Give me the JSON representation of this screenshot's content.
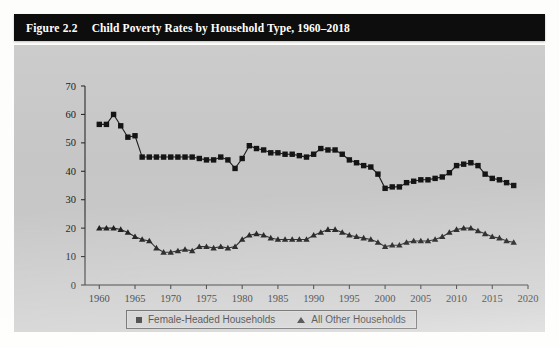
{
  "figure": {
    "number": "Figure 2.2",
    "title": "Child Poverty Rates by Household Type, 1960–2018"
  },
  "legend": {
    "items": [
      {
        "label": "Female-Headed Households",
        "marker": "square-marker"
      },
      {
        "label": "All Other Households",
        "marker": "triangle-marker"
      }
    ]
  },
  "chart_data": {
    "type": "line",
    "title": "Child Poverty Rates by Household Type, 1960–2018",
    "xlabel": "",
    "ylabel": "",
    "xlim": [
      1958,
      2020
    ],
    "ylim": [
      0,
      70
    ],
    "yticks": [
      0,
      10,
      20,
      30,
      40,
      50,
      60,
      70
    ],
    "xticks": [
      1960,
      1965,
      1970,
      1975,
      1980,
      1985,
      1990,
      1995,
      2000,
      2005,
      2010,
      2015,
      2020
    ],
    "grid": false,
    "legend_position": "bottom",
    "x": [
      1960,
      1961,
      1962,
      1963,
      1964,
      1965,
      1966,
      1967,
      1968,
      1969,
      1970,
      1971,
      1972,
      1973,
      1974,
      1975,
      1976,
      1977,
      1978,
      1979,
      1980,
      1981,
      1982,
      1983,
      1984,
      1985,
      1986,
      1987,
      1988,
      1989,
      1990,
      1991,
      1992,
      1993,
      1994,
      1995,
      1996,
      1997,
      1998,
      1999,
      2000,
      2001,
      2002,
      2003,
      2004,
      2005,
      2006,
      2007,
      2008,
      2009,
      2010,
      2011,
      2012,
      2013,
      2014,
      2015,
      2016,
      2017,
      2018
    ],
    "series": [
      {
        "name": "Female-Headed Households",
        "marker": "square",
        "values": [
          56.5,
          56.5,
          60.0,
          56.0,
          52.0,
          52.5,
          45.0,
          45.0,
          45.0,
          45.0,
          45.0,
          45.0,
          45.0,
          45.0,
          44.5,
          44.0,
          44.0,
          45.0,
          44.0,
          41.0,
          44.5,
          49.0,
          48.0,
          47.5,
          46.5,
          46.5,
          46.0,
          46.0,
          45.5,
          45.0,
          46.0,
          48.0,
          47.5,
          47.5,
          46.0,
          44.0,
          43.0,
          42.0,
          41.5,
          39.0,
          34.0,
          34.5,
          34.5,
          36.0,
          36.5,
          37.0,
          37.0,
          37.5,
          38.0,
          39.5,
          42.0,
          42.5,
          43.0,
          42.0,
          39.0,
          37.5,
          37.0,
          36.0,
          35.0
        ]
      },
      {
        "name": "All Other Households",
        "marker": "triangle",
        "values": [
          20.0,
          20.0,
          20.0,
          19.5,
          18.5,
          17.0,
          16.0,
          15.5,
          13.0,
          11.5,
          11.5,
          12.0,
          12.5,
          12.0,
          13.5,
          13.5,
          13.0,
          13.5,
          13.0,
          13.5,
          16.0,
          17.5,
          18.0,
          17.5,
          16.5,
          16.0,
          16.0,
          16.0,
          16.0,
          16.0,
          17.5,
          18.5,
          19.5,
          19.5,
          18.5,
          17.5,
          17.0,
          16.5,
          16.0,
          15.0,
          13.5,
          14.0,
          14.0,
          15.0,
          15.5,
          15.5,
          15.5,
          16.0,
          17.0,
          18.5,
          19.5,
          20.0,
          20.0,
          19.0,
          18.0,
          17.0,
          16.5,
          15.5,
          15.0
        ]
      }
    ]
  }
}
